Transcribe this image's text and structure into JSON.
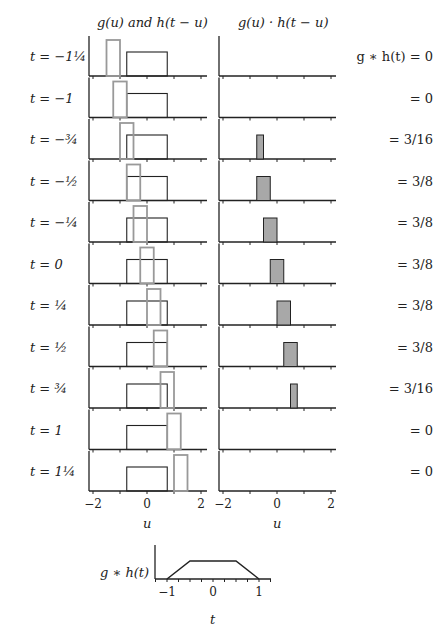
{
  "headers": {
    "left": "g(u) and h(t − u)",
    "right": "g(u) · h(t − u)"
  },
  "rows": [
    {
      "t": "t = −1¼",
      "result": "g ∗ h(t) = 0",
      "t_val": -1.25,
      "product": null
    },
    {
      "t": "t = −1",
      "result": "= 0",
      "t_val": -1,
      "product": null
    },
    {
      "t": "t = −¾",
      "result": "= 3/16",
      "t_val": -0.75,
      "product": [
        -0.75,
        -0.5
      ]
    },
    {
      "t": "t = −½",
      "result": "= 3/8",
      "t_val": -0.5,
      "product": [
        -0.75,
        -0.25
      ]
    },
    {
      "t": "t = −¼",
      "result": "= 3/8",
      "t_val": -0.25,
      "product": [
        -0.5,
        0
      ]
    },
    {
      "t": "t = 0",
      "result": "= 3/8",
      "t_val": 0,
      "product": [
        -0.25,
        0.25
      ]
    },
    {
      "t": "t = ¼",
      "result": "= 3/8",
      "t_val": 0.25,
      "product": [
        0,
        0.5
      ]
    },
    {
      "t": "t = ½",
      "result": "= 3/8",
      "t_val": 0.5,
      "product": [
        0.25,
        0.75
      ]
    },
    {
      "t": "t = ¾",
      "result": "= 3/16",
      "t_val": 0.75,
      "product": [
        0.5,
        0.75
      ]
    },
    {
      "t": "t = 1",
      "result": "= 0",
      "t_val": 1,
      "product": null
    },
    {
      "t": "t = 1¼",
      "result": "= 0",
      "t_val": 1.25,
      "product": null
    }
  ],
  "axes": {
    "u_ticks": [
      "−2",
      "0",
      "2"
    ],
    "u_label": "u",
    "t_ticks": [
      "−1",
      "0",
      "1"
    ],
    "t_label": "t",
    "bottom_ylabel": "g ∗ h(t)"
  },
  "chart_data": {
    "type": "line",
    "g_rect": {
      "from": -0.75,
      "to": 0.75,
      "height": 0.5
    },
    "h_rect": {
      "width": 0.5,
      "height": 0.75,
      "center_at": "t"
    },
    "panels_xlim": [
      -2,
      2
    ],
    "t_values": [
      -1.25,
      -1,
      -0.75,
      -0.5,
      -0.25,
      0,
      0.25,
      0.5,
      0.75,
      1,
      1.25
    ],
    "convolution_values": [
      "0",
      "0",
      "3/16",
      "3/8",
      "3/8",
      "3/8",
      "3/8",
      "3/8",
      "3/16",
      "0",
      "0"
    ],
    "result_curve": {
      "x": [
        -1,
        -0.5,
        0.5,
        1
      ],
      "y": [
        0,
        0.375,
        0.375,
        0
      ]
    },
    "xlabel_panels": "u",
    "xlabel_result": "t",
    "ylabel_result": "g ∗ h(t)",
    "colors": {
      "g": "#222222",
      "h": "#999999",
      "product_fill": "#a8a8a8"
    }
  }
}
